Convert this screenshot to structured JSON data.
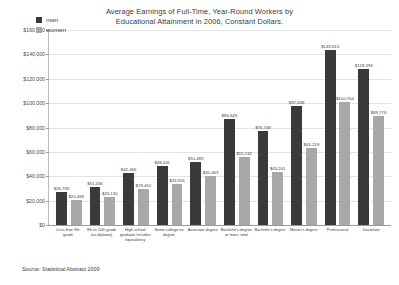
{
  "chart_data": {
    "type": "bar",
    "title": "Average Earnings of Full-Time, Year-Round Workers by Educational Attainment in 2006, Constant Dollars.",
    "title_line1": "Average Earnings of Full-Time, Year-Round Workers by",
    "title_line2": "Educational Attainment in 2006, Constant Dollars.",
    "xlabel": "",
    "ylabel": "",
    "ylim": [
      0,
      160000
    ],
    "ytick_values": [
      0,
      20000,
      40000,
      60000,
      80000,
      100000,
      120000,
      140000,
      160000
    ],
    "ytick_labels": [
      "$0",
      "$20,000",
      "$40,000",
      "$60,000",
      "$80,000",
      "$100,000",
      "$120,000",
      "$140,000",
      "$160,000"
    ],
    "grid": true,
    "legend_position": "top-left",
    "categories": [
      "Less than 9th grade",
      "9th to 12th grade (no diploma)",
      "High school graduate includes equivalency",
      "Some college no degree",
      "Associate degree",
      "Bachelor's degree or more, total",
      "Bachelor's degree",
      "Master's degree",
      "Professional",
      "Doctorate"
    ],
    "series": [
      {
        "name": "men",
        "color": "#3a3a3a",
        "values": [
          26769,
          31436,
          42466,
          48431,
          51485,
          86643,
          76749,
          97638,
          143613,
          128393
        ],
        "labels": [
          "$26,769",
          "$31,436",
          "$42,466",
          "$48,431",
          "$51,485",
          "$86,643",
          "$76,749",
          "$97,638",
          "$143,613",
          "$128,393"
        ]
      },
      {
        "name": "women",
        "color": "#a8a8a8",
        "values": [
          20469,
          23130,
          29410,
          33916,
          40463,
          55532,
          43201,
          63219,
          100704,
          89776
        ],
        "labels": [
          "$20,469",
          "$23,130",
          "$29,410",
          "$33,916",
          "$40,463",
          "$55,532",
          "$43,201",
          "$63,219",
          "$100,704",
          "$89,776"
        ]
      }
    ]
  },
  "legend": {
    "items": [
      {
        "label": "men",
        "color": "#3a3a3a"
      },
      {
        "label": "women",
        "color": "#a8a8a8"
      }
    ]
  },
  "source": {
    "text": "Source: Statistical Abstract 2009"
  }
}
